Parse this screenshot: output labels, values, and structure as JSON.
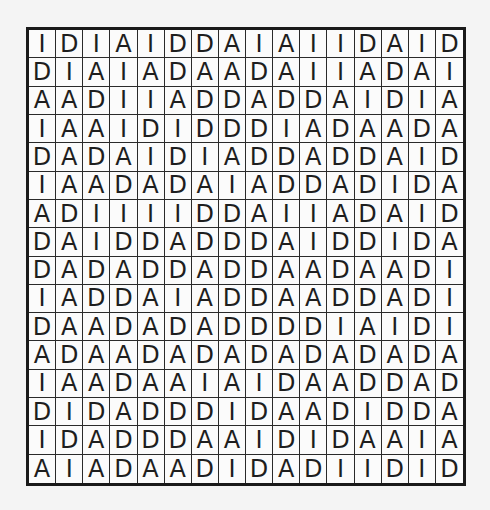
{
  "puzzle": {
    "rows": [
      [
        "I",
        "D",
        "I",
        "A",
        "I",
        "D",
        "D",
        "A",
        "I",
        "A",
        "I",
        "I",
        "D",
        "A",
        "I",
        "D"
      ],
      [
        "D",
        "I",
        "A",
        "I",
        "A",
        "D",
        "A",
        "A",
        "D",
        "A",
        "I",
        "I",
        "A",
        "D",
        "A",
        "I"
      ],
      [
        "A",
        "A",
        "D",
        "I",
        "I",
        "A",
        "D",
        "D",
        "A",
        "D",
        "D",
        "A",
        "I",
        "D",
        "I",
        "A"
      ],
      [
        "I",
        "A",
        "A",
        "I",
        "D",
        "I",
        "D",
        "D",
        "D",
        "I",
        "A",
        "D",
        "A",
        "A",
        "D",
        "A"
      ],
      [
        "D",
        "A",
        "D",
        "A",
        "I",
        "D",
        "I",
        "A",
        "D",
        "D",
        "A",
        "D",
        "D",
        "A",
        "I",
        "D"
      ],
      [
        "I",
        "A",
        "A",
        "D",
        "A",
        "D",
        "A",
        "I",
        "A",
        "D",
        "D",
        "A",
        "D",
        "I",
        "D",
        "A"
      ],
      [
        "A",
        "D",
        "I",
        "I",
        "I",
        "I",
        "D",
        "D",
        "A",
        "I",
        "I",
        "A",
        "D",
        "A",
        "I",
        "D"
      ],
      [
        "D",
        "A",
        "I",
        "D",
        "D",
        "A",
        "D",
        "D",
        "D",
        "A",
        "I",
        "D",
        "D",
        "I",
        "D",
        "A"
      ],
      [
        "D",
        "A",
        "D",
        "A",
        "D",
        "D",
        "A",
        "D",
        "D",
        "A",
        "A",
        "D",
        "A",
        "A",
        "D",
        "I"
      ],
      [
        "I",
        "A",
        "D",
        "D",
        "A",
        "I",
        "A",
        "D",
        "D",
        "A",
        "A",
        "D",
        "D",
        "A",
        "D",
        "I"
      ],
      [
        "D",
        "A",
        "A",
        "D",
        "A",
        "D",
        "A",
        "D",
        "D",
        "D",
        "D",
        "I",
        "A",
        "I",
        "D",
        "I"
      ],
      [
        "A",
        "D",
        "A",
        "A",
        "D",
        "A",
        "D",
        "A",
        "D",
        "A",
        "D",
        "A",
        "D",
        "A",
        "D",
        "A"
      ],
      [
        "I",
        "A",
        "A",
        "D",
        "A",
        "A",
        "I",
        "A",
        "I",
        "D",
        "A",
        "A",
        "D",
        "D",
        "A",
        "D"
      ],
      [
        "D",
        "I",
        "D",
        "A",
        "D",
        "D",
        "D",
        "I",
        "D",
        "A",
        "A",
        "D",
        "I",
        "D",
        "D",
        "A"
      ],
      [
        "I",
        "D",
        "A",
        "D",
        "D",
        "D",
        "A",
        "A",
        "I",
        "D",
        "I",
        "D",
        "A",
        "A",
        "I",
        "A"
      ],
      [
        "A",
        "I",
        "A",
        "D",
        "A",
        "A",
        "D",
        "I",
        "D",
        "A",
        "D",
        "I",
        "I",
        "D",
        "I",
        "D"
      ]
    ]
  }
}
